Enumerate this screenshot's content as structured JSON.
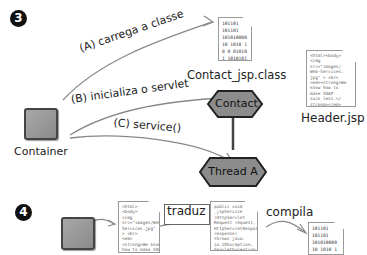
{
  "step3": {
    "badge": "3",
    "container_label": "Container",
    "arrows": [
      {
        "label": "(A) carrega a classe"
      },
      {
        "label": "(B) inicializa o servlet"
      },
      {
        "label": "(C) service()"
      }
    ],
    "class_file": {
      "label": "Contact_jsp.class",
      "content": "101101\n101101\n101010000\n10 1010 1\n0 0 01010\n1 1010101"
    },
    "jsp_file": {
      "label": "Header.jsp",
      "content": "<html><body>\n<img\nsrc=\"images/\nWeb-Services.\njpg\" > <br>\n<em><strong>We\nknow how to\nmake SOAP\nsuck less.</\nstrong></em>\n<br></body>\n</html>"
    },
    "servlet_node": "Contact",
    "thread_node": "Thread A"
  },
  "step4": {
    "badge": "4",
    "jsp_content": "<html>\n<body>\n<img\nsrc=\"images/Web-\nServices.jpg\"\n> <br>\n<em>\n<strong>We know\nhow to make SOAP\nsuck less.</\nstrong></em>\n<br></body>\n</html>",
    "translate_label": "traduz",
    "java_content": "public void\n_jspService\n(HttpServlet\nRequest request,\nHttpServletResponse\nresponse)\nthrows java.\nio.IOException,\nServletException",
    "compile_label": "compila",
    "class_content": "101101\n101101\n101010000\n10 1010 1"
  },
  "colors": {
    "node_fill": "#8c8c8c",
    "node_border": "#333333",
    "line": "#777777"
  }
}
